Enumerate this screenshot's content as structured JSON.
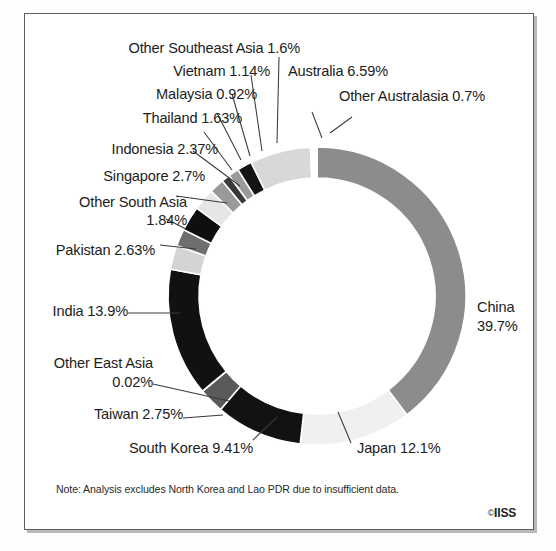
{
  "figure": {
    "note": "Note: Analysis excludes North Korea and Lao PDR due to insufficient data.",
    "credit": "IISS",
    "copyright_symbol": "©"
  },
  "chart_data": {
    "type": "pie",
    "variant": "donut",
    "title": "",
    "xlabel": "",
    "ylabel": "",
    "units": "%",
    "start_angle_deg": 0,
    "direction": "clockwise",
    "total": 100,
    "legend": "none",
    "grid": false,
    "labels": [
      "China",
      "Japan",
      "South Korea",
      "Taiwan",
      "Other East Asia",
      "India",
      "Pakistan",
      "Other South Asia",
      "Singapore",
      "Indonesia",
      "Thailand",
      "Malaysia",
      "Vietnam",
      "Other Southeast Asia",
      "Australia",
      "Other Australasia"
    ],
    "values": [
      39.7,
      12.1,
      9.41,
      2.75,
      0.02,
      13.9,
      2.63,
      1.84,
      2.7,
      2.37,
      1.63,
      0.92,
      1.14,
      1.6,
      6.59,
      0.7
    ],
    "value_labels": [
      "39.7%",
      "12.1%",
      "9.41%",
      "2.75%",
      "0.02%",
      "13.9%",
      "2.63%",
      "1.84%",
      "2.7%",
      "2.37%",
      "1.63%",
      "0.92%",
      "1.14%",
      "1.6%",
      "6.59%",
      "0.7%"
    ],
    "colors": [
      "#8c8c8c",
      "#f0f0ee",
      "#121212",
      "#5a5a5a",
      "#8c8c8c",
      "#111111",
      "#d4d4d4",
      "#6e6e6e",
      "#0f0f0f",
      "#e6e6e4",
      "#9a9a9a",
      "#3a3a3a",
      "#9a9a9a",
      "#141414",
      "#d8d8d8",
      "#ffffff"
    ]
  },
  "callouts": {
    "other_southeast_asia": "Other Southeast Asia  1.6%",
    "vietnam": "Vietnam  1.14%",
    "malaysia": "Malaysia  0.92%",
    "thailand": "Thailand  1.63%",
    "indonesia": "Indonesia  2.37%",
    "singapore": "Singapore  2.7%",
    "other_south_asia_l1": "Other South Asia",
    "other_south_asia_l2": "1.84%",
    "pakistan": "Pakistan  2.63%",
    "india": "India   13.9%",
    "other_east_asia_l1": "Other East Asia",
    "other_east_asia_l2": "0.02%",
    "taiwan": "Taiwan  2.75%",
    "south_korea": "South Korea  9.41%",
    "japan": "Japan   12.1%",
    "china_l1": "China",
    "china_l2": "39.7%",
    "australia": "Australia  6.59%",
    "other_australasia": "Other Australasia  0.7%"
  }
}
